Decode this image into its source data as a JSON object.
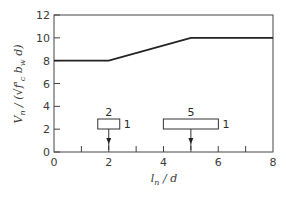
{
  "chart_data": {
    "type": "line",
    "title": "",
    "xlabel": "l_n / d",
    "ylabel": "V_n / (√f'_c b_w d)",
    "xlim": [
      0,
      8
    ],
    "ylim": [
      0,
      12
    ],
    "x_ticks": [
      "0",
      "2",
      "4",
      "6",
      "8"
    ],
    "x_minor_ticks": [
      1,
      2,
      3,
      4,
      5,
      6,
      7
    ],
    "y_ticks": [
      "0",
      "2",
      "4",
      "6",
      "8",
      "10",
      "12"
    ],
    "grid": false,
    "legend": null,
    "series": [
      {
        "name": "V_n / (√f'_c b_w d)",
        "x": [
          0,
          2,
          5,
          8
        ],
        "y": [
          8,
          8,
          10,
          10
        ]
      }
    ],
    "annotations": [
      {
        "type": "beam-box",
        "top_label": "2",
        "side_label": "1",
        "arrow_x": 2,
        "description": "Beam with span/depth ratio 2:1, load arrow at l_n/d = 2"
      },
      {
        "type": "beam-box",
        "top_label": "5",
        "side_label": "1",
        "arrow_x": 5,
        "description": "Beam with span/depth ratio 5:1, load arrow at l_n/d = 5"
      }
    ]
  },
  "labels": {
    "ylabel_main": "V",
    "ylabel_sub": "n",
    "ylabel_rest1": " / (",
    "ylabel_sqrt": "√",
    "ylabel_f": "f'",
    "ylabel_fsub": "c",
    "ylabel_b": " b",
    "ylabel_bsub": "w",
    "ylabel_d": " d)",
    "xlabel_l": "l",
    "xlabel_sub": "n",
    "xlabel_rest": " / d",
    "box1_top": "2",
    "box1_side": "1",
    "box2_top": "5",
    "box2_side": "1"
  }
}
